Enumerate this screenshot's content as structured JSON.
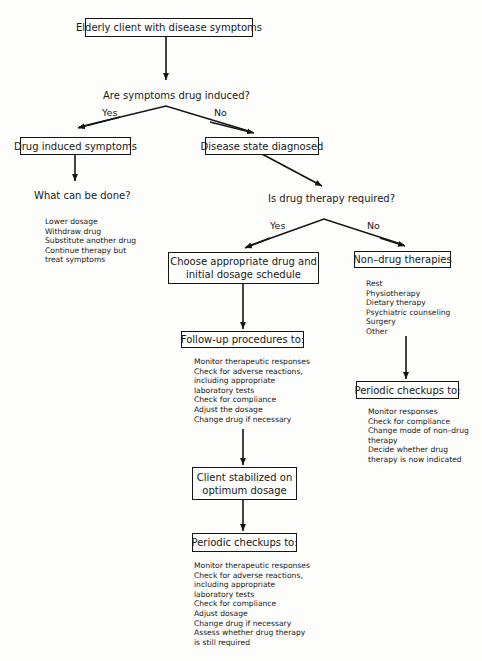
{
  "nodes": {
    "start": "Elderly client with disease symptoms",
    "q1": "Are symptoms drug induced?",
    "q1_yes": "Yes",
    "q1_no": "No",
    "drug_induced": "Drug induced symptoms",
    "disease_diagnosed": "Disease state diagnosed",
    "what_done": "What can be done?",
    "q2": "Is drug therapy required?",
    "q2_yes": "Yes",
    "q2_no": "No",
    "choose_drug_line1": "Choose appropriate drug and",
    "choose_drug_line2": "initial dosage schedule",
    "non_drug": "Non–drug therapies",
    "followup": "Follow-up procedures to:",
    "stabilized_line1": "Client stabilized on",
    "stabilized_line2": "optimum dosage",
    "periodic_mid": "Periodic checkups to:",
    "periodic_right": "Periodic checkups to:"
  },
  "lists": {
    "what_done": [
      "Lower dosage",
      "Withdraw drug",
      "Substitute another drug",
      "Continue therapy but",
      "treat symptoms"
    ],
    "non_drug": [
      "Rest",
      "Physiotherapy",
      "Dietary therapy",
      "Psychiatric counseling",
      "Surgery",
      "Other"
    ],
    "followup": [
      "Monitor therapeutic responses",
      "Check for adverse reactions,",
      "including appropriate",
      "laboratory tests",
      "Check for compliance",
      "Adjust the dosage",
      "Change drug if necessary"
    ],
    "periodic_right": [
      "Monitor responses",
      "Check for compliance",
      "Change mode of non–drug",
      "therapy",
      "Decide whether drug",
      "therapy is now indicated"
    ],
    "periodic_mid": [
      "Monitor therapeutic responses",
      "Check for adverse reactions,",
      "including appropriate",
      "laboratory tests",
      "Check for compliance",
      "Adjust dosage",
      "Change drug if necessary",
      "Assess whether drug therapy",
      "is still required"
    ]
  },
  "colors": {
    "ink": "#151515",
    "paper": "#fdfdfb"
  }
}
